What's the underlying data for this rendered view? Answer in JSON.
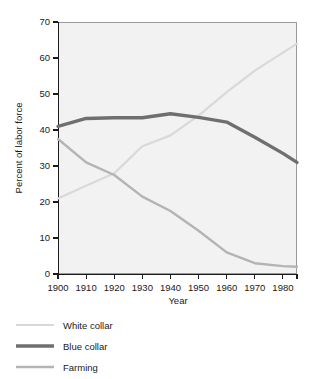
{
  "chart_data": {
    "type": "line",
    "title": "",
    "xlabel": "Year",
    "ylabel": "Percent of labor force",
    "xlim": [
      1900,
      1985
    ],
    "ylim": [
      0,
      70
    ],
    "grid": false,
    "legend_position": "below-left",
    "x": [
      1900,
      1910,
      1920,
      1930,
      1940,
      1950,
      1960,
      1970,
      1980,
      1985
    ],
    "xticks": [
      1900,
      1910,
      1920,
      1930,
      1940,
      1950,
      1960,
      1970,
      1980,
      1985
    ],
    "xticklabels": [
      "1900",
      "1910",
      "1920",
      "1930",
      "1940",
      "1950",
      "1960",
      "1970",
      "1980",
      ""
    ],
    "yticks": [
      0,
      10,
      20,
      30,
      40,
      50,
      60,
      70
    ],
    "yticklabels": [
      "0",
      "10",
      "20",
      "30",
      "40",
      "50",
      "60",
      "70"
    ],
    "series": [
      {
        "name": "White collar",
        "color": "#d9d9d9",
        "width": 2.2,
        "values": [
          21.0,
          24.5,
          28.0,
          35.5,
          38.5,
          44.0,
          50.5,
          56.5,
          61.5,
          64.0
        ]
      },
      {
        "name": "Blue collar",
        "color": "#6f6f6f",
        "width": 3.4,
        "values": [
          41.0,
          43.2,
          43.4,
          43.4,
          44.5,
          43.5,
          42.2,
          38.0,
          33.5,
          31.0
        ]
      },
      {
        "name": "Farming",
        "color": "#b4b4b4",
        "width": 2.4,
        "values": [
          37.5,
          31.0,
          27.5,
          21.5,
          17.5,
          12.0,
          6.0,
          3.0,
          2.2,
          2.0
        ]
      }
    ]
  },
  "axes": {
    "y_title": "Percent of labor force",
    "x_title": "Year"
  },
  "legend": {
    "entries": [
      {
        "label": "White collar",
        "color": "#d9d9d9",
        "width": 2.2
      },
      {
        "label": "Blue collar",
        "color": "#6f6f6f",
        "width": 3.4
      },
      {
        "label": "Farming",
        "color": "#b4b4b4",
        "width": 2.4
      }
    ]
  },
  "colors": {
    "plot_background": "#f2f2f2",
    "page_background": "#ffffff",
    "axis": "#1a1a1a",
    "frame": "#9a9a9a"
  }
}
